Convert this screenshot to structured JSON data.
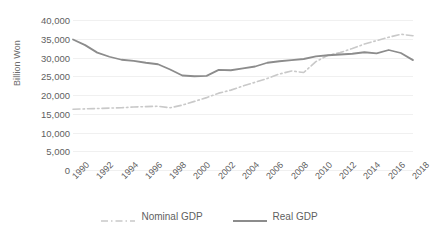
{
  "chart_data": {
    "type": "line",
    "title": "",
    "xlabel": "",
    "ylabel": "Billion Won",
    "ylim": [
      0,
      40000
    ],
    "ytick_labels": [
      "40,000",
      "35,000",
      "30,000",
      "25,000",
      "20,000",
      "15,000",
      "10,000",
      "5,000",
      "0"
    ],
    "ytick_values": [
      40000,
      35000,
      30000,
      25000,
      20000,
      15000,
      10000,
      5000,
      0
    ],
    "grid": true,
    "legend_position": "bottom",
    "x": [
      1990,
      1991,
      1992,
      1993,
      1994,
      1995,
      1996,
      1997,
      1998,
      1999,
      2000,
      2001,
      2002,
      2003,
      2004,
      2005,
      2006,
      2007,
      2008,
      2009,
      2010,
      2011,
      2012,
      2013,
      2014,
      2015,
      2016,
      2017,
      2018
    ],
    "xtick_labels": [
      "1990",
      "1992",
      "1994",
      "1996",
      "1998",
      "2000",
      "2002",
      "2004",
      "2006",
      "2008",
      "2010",
      "2012",
      "2014",
      "2016",
      "2018"
    ],
    "series": [
      {
        "name": "Nominal GDP",
        "style": "dash-dot",
        "color": "#c9c9c9",
        "values": [
          16200,
          16300,
          16400,
          16500,
          16600,
          16800,
          16900,
          17000,
          16600,
          17300,
          18300,
          19300,
          20500,
          21300,
          22400,
          23400,
          24400,
          25600,
          26400,
          26000,
          28900,
          30600,
          31300,
          32400,
          33600,
          34500,
          35400,
          36200,
          35800
        ]
      },
      {
        "name": "Real GDP",
        "style": "solid",
        "color": "#8c8c8c",
        "values": [
          34800,
          33300,
          31300,
          30200,
          29400,
          29100,
          28600,
          28200,
          26800,
          25200,
          25000,
          25100,
          26700,
          26600,
          27100,
          27600,
          28600,
          29000,
          29300,
          29600,
          30300,
          30600,
          30800,
          31000,
          31400,
          31100,
          32000,
          31200,
          29300
        ]
      }
    ]
  },
  "legend": {
    "items": [
      {
        "label": "Nominal GDP",
        "icon": "dash-dot-line-swatch"
      },
      {
        "label": "Real GDP",
        "icon": "solid-line-swatch"
      }
    ]
  },
  "axes": {
    "y_title": "Billion Won"
  },
  "colors": {
    "nominal": "#c9c9c9",
    "real": "#8c8c8c",
    "grid": "#f0f0f0",
    "text": "#5f5f5f",
    "background": "#ffffff"
  }
}
